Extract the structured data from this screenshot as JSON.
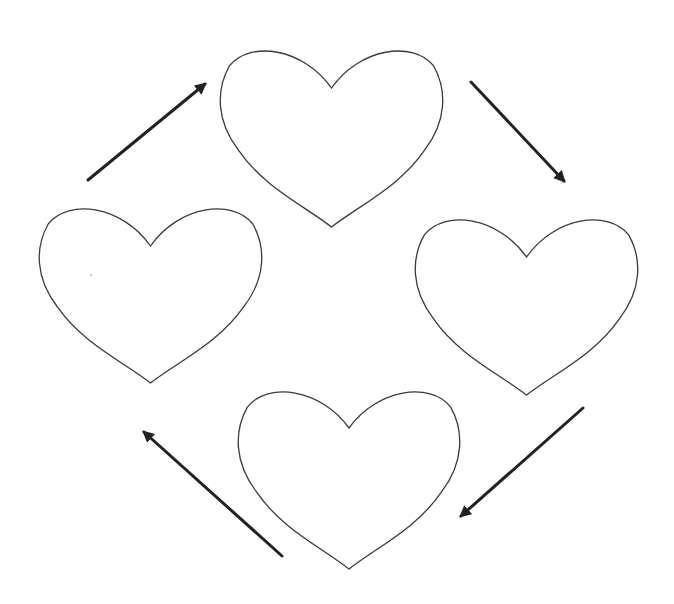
{
  "diagram": {
    "nodes": [
      {
        "id": "heart-top",
        "label": ""
      },
      {
        "id": "heart-right",
        "label": ""
      },
      {
        "id": "heart-bottom",
        "label": ""
      },
      {
        "id": "heart-left",
        "label": ""
      }
    ],
    "edges": [
      {
        "from": "heart-left",
        "to": "heart-top",
        "style": "arrow"
      },
      {
        "from": "heart-top",
        "to": "heart-right",
        "style": "arrow"
      },
      {
        "from": "heart-right",
        "to": "heart-bottom",
        "style": "arrow"
      },
      {
        "from": "heart-bottom",
        "to": "heart-left",
        "style": "arrow"
      }
    ],
    "direction": "clockwise",
    "colors": {
      "outline": "#3a3a3a",
      "arrow": "#222222",
      "background": "#ffffff"
    }
  }
}
